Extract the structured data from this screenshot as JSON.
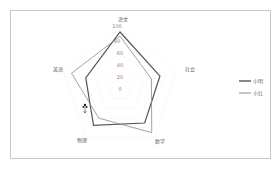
{
  "chart_data": {
    "type": "radar",
    "title": "",
    "axes": [
      "语文",
      "社会",
      "数学",
      "物理",
      "英语"
    ],
    "ticks": [
      "0",
      "20",
      "40",
      "60",
      "80",
      "100"
    ],
    "range": [
      0,
      100
    ],
    "grid": true,
    "legend_position": "right",
    "series": [
      {
        "name": "小明",
        "values": [
          95,
          70,
          70,
          75,
          60
        ],
        "color": "#555555",
        "width": 1.2
      },
      {
        "name": "小红",
        "values": [
          88,
          55,
          90,
          60,
          85
        ],
        "color": "#8a8a8a",
        "width": 0.8
      }
    ]
  },
  "legend": {
    "items": [
      {
        "label": "小明",
        "color": "#555555"
      },
      {
        "label": "小红",
        "color": "#8a8a8a"
      }
    ]
  },
  "colors": {
    "frame": "#c8c8c8",
    "grid": "#e8e8e8"
  }
}
